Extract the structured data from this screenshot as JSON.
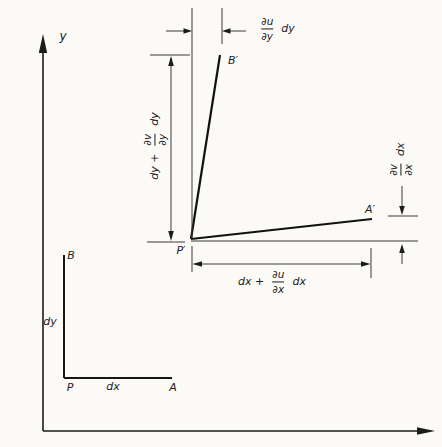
{
  "colors": {
    "background": "#fbfaf7",
    "line": "#1c1c1c",
    "dim_line": "#3a3a3a"
  },
  "axes": {
    "y_label": "y"
  },
  "original_element": {
    "p": "P",
    "a": "A",
    "b": "B",
    "dx": "dx",
    "dy": "dy"
  },
  "deformed_element": {
    "p": "P′",
    "a": "A′",
    "b": "B′"
  },
  "dims": {
    "top": {
      "num": "∂u",
      "den": "∂y",
      "suffix": "dy"
    },
    "left": {
      "prefix": "dy +",
      "num": "∂v",
      "den": "∂y",
      "suffix": "dy"
    },
    "right": {
      "num": "∂v",
      "den": "∂x",
      "suffix": "dx"
    },
    "bottom": {
      "prefix": "dx +",
      "num": "∂u",
      "den": "∂x",
      "suffix": "dx"
    }
  }
}
